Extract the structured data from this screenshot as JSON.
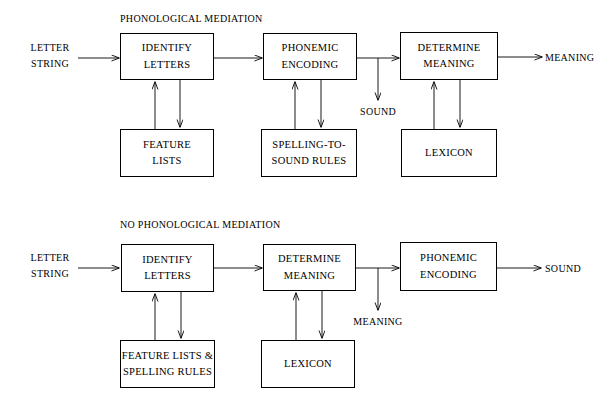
{
  "diagram": {
    "title_top": "PHONOLOGICAL MEDIATION",
    "title_bottom": "NO PHONOLOGICAL MEDIATION",
    "ink": "#000000",
    "paper": "#ffffff"
  },
  "model_phonological": {
    "title": "PHONOLOGICAL MEDIATION",
    "input_label_line1": "LETTER",
    "input_label_line2": "STRING",
    "output_label": "MEANING",
    "branch_label": "SOUND",
    "boxes": {
      "identify_letters_line1": "IDENTIFY",
      "identify_letters_line2": "LETTERS",
      "phonemic_encoding_line1": "PHONEMIC",
      "phonemic_encoding_line2": "ENCODING",
      "determine_meaning_line1": "DETERMINE",
      "determine_meaning_line2": "MEANING",
      "feature_lists_line1": "FEATURE",
      "feature_lists_line2": "LISTS",
      "spelling_rules_line1": "SPELLING-TO-",
      "spelling_rules_line2": "SOUND RULES",
      "lexicon": "LEXICON"
    }
  },
  "model_direct": {
    "title": "NO PHONOLOGICAL MEDIATION",
    "input_label_line1": "LETTER",
    "input_label_line2": "STRING",
    "output_label": "SOUND",
    "branch_label": "MEANING",
    "boxes": {
      "identify_letters_line1": "IDENTIFY",
      "identify_letters_line2": "LETTERS",
      "determine_meaning_line1": "DETERMINE",
      "determine_meaning_line2": "MEANING",
      "phonemic_encoding_line1": "PHONEMIC",
      "phonemic_encoding_line2": "ENCODING",
      "feature_spelling_line1": "FEATURE LISTS &",
      "feature_spelling_line2": "SPELLING RULES",
      "lexicon": "LEXICON"
    }
  }
}
